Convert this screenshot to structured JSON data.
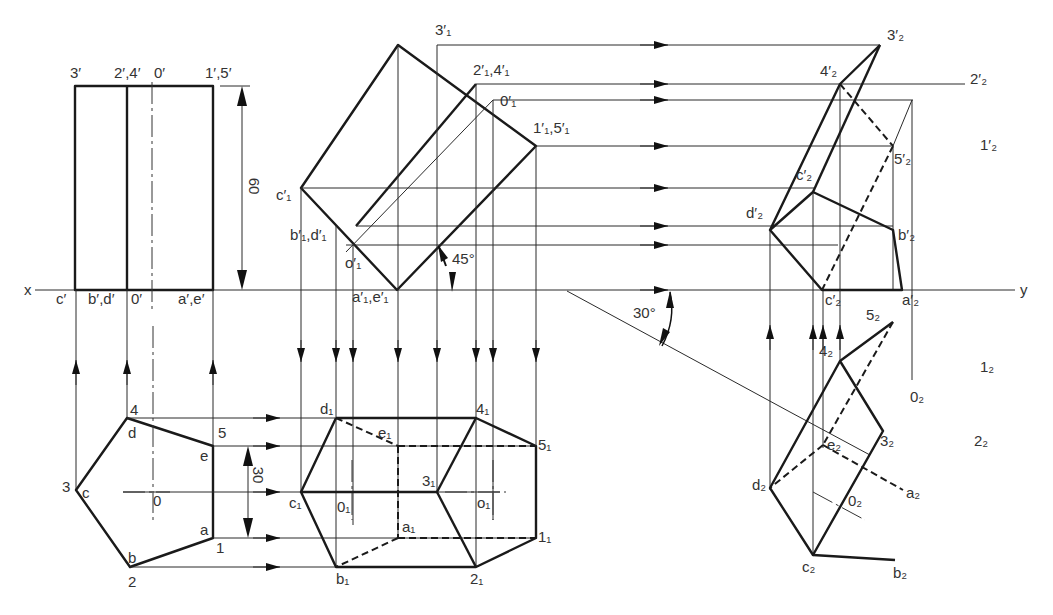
{
  "figure": {
    "axis": {
      "x_label": "x",
      "y_label": "y"
    },
    "dimensions": {
      "height": "60",
      "half_width": "30"
    },
    "angles": {
      "tilt": "45°",
      "rotation": "30°"
    },
    "views": {
      "front": {
        "top_labels": [
          "3′",
          "2′,4′",
          "0′",
          "1′,5′"
        ],
        "bottom_labels": [
          "c′",
          "b′,d′",
          "0′",
          "a′,e′"
        ]
      },
      "top": {
        "labels": [
          "4",
          "d",
          "5",
          "e",
          "3",
          "c",
          "0",
          "a",
          "1",
          "b",
          "2"
        ]
      },
      "front_tilted": {
        "labels": [
          "3′₁",
          "2′₁,4′₁",
          "0′₁",
          "1′₁,5′₁",
          "c′₁",
          "b′₁,d′₁",
          "o′₁",
          "a′₁,e′₁"
        ]
      },
      "top_aux": {
        "labels": [
          "d₁",
          "e₁",
          "4₁",
          "5₁",
          "c₁",
          "0₁",
          "3₁",
          "o₁",
          "a₁",
          "1₁",
          "b₁",
          "2₁"
        ]
      },
      "side_aux": {
        "labels": [
          "3′₂",
          "4′₂",
          "2′₂",
          "1′₂",
          "c′₂",
          "5′₂",
          "d′₂",
          "b′₂",
          "c′₂",
          "a′₂"
        ]
      },
      "bottom_aux": {
        "labels": [
          "5₂",
          "4₂",
          "1₂",
          "0₂",
          "2₂",
          "e₂",
          "3₂",
          "d₂",
          "a₂",
          "0₂",
          "c₂",
          "b₂"
        ]
      }
    }
  }
}
